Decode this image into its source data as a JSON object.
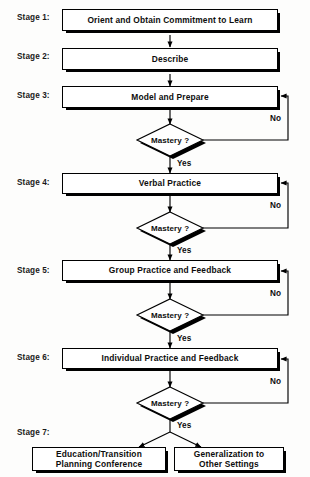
{
  "diagram": {
    "type": "flowchart",
    "decision_label": "Mastery ?",
    "yes_label": "Yes",
    "no_label": "No",
    "colors": {
      "line": "#000000",
      "box_fill": "#ffffff",
      "text": "#0d0d0d",
      "background": "#fdfdfc"
    }
  },
  "stages": [
    {
      "label": "Stage 1:",
      "box": "Orient and Obtain Commitment to Learn"
    },
    {
      "label": "Stage 2:",
      "box": "Describe"
    },
    {
      "label": "Stage 3:",
      "box": "Model and Prepare"
    },
    {
      "label": "Stage 4:",
      "box": "Verbal Practice"
    },
    {
      "label": "Stage 5:",
      "box": "Group Practice and Feedback"
    },
    {
      "label": "Stage 6:",
      "box": "Individual Practice and Feedback"
    },
    {
      "label": "Stage 7:",
      "box": ""
    }
  ],
  "decisions": [
    {
      "id": "mastery-1",
      "label": "Mastery ?",
      "yes": "Yes",
      "no": "No",
      "loops_to": "Stage 3"
    },
    {
      "id": "mastery-2",
      "label": "Mastery ?",
      "yes": "Yes",
      "no": "No",
      "loops_to": "Stage 4"
    },
    {
      "id": "mastery-3",
      "label": "Mastery ?",
      "yes": "Yes",
      "no": "No",
      "loops_to": "Stage 5"
    },
    {
      "id": "mastery-4",
      "label": "Mastery ?",
      "yes": "Yes",
      "no": "No",
      "loops_to": "Stage 6"
    }
  ],
  "outcomes": [
    {
      "line1": "Education/Transition",
      "line2": "Planning Conference"
    },
    {
      "line1": "Generalization to",
      "line2": "Other Settings"
    }
  ]
}
